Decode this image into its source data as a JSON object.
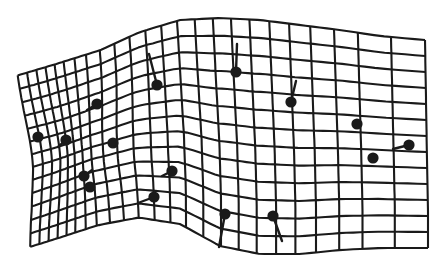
{
  "figure": {
    "type": "thin-plate-spline deformation grid",
    "width": 442,
    "height": 271,
    "background": "#ffffff",
    "ink_color": "#1a1a1a",
    "grid": {
      "columns": 24,
      "rows": 13,
      "line_width": 2.1,
      "outline": {
        "top": [
          [
            17,
            75
          ],
          [
            60,
            62
          ],
          [
            100,
            50
          ],
          [
            140,
            32
          ],
          [
            180,
            20
          ],
          [
            220,
            18
          ],
          [
            260,
            20
          ],
          [
            300,
            25
          ],
          [
            340,
            30
          ],
          [
            380,
            36
          ],
          [
            425,
            40
          ]
        ],
        "bottom": [
          [
            30,
            247
          ],
          [
            60,
            238
          ],
          [
            100,
            226
          ],
          [
            140,
            218
          ],
          [
            180,
            224
          ],
          [
            220,
            246
          ],
          [
            260,
            254
          ],
          [
            300,
            254
          ],
          [
            340,
            250
          ],
          [
            380,
            248
          ],
          [
            428,
            248
          ]
        ],
        "left": [
          [
            17,
            75
          ],
          [
            22,
            120
          ],
          [
            28,
            170
          ],
          [
            30,
            210
          ],
          [
            30,
            247
          ]
        ],
        "right": [
          [
            425,
            40
          ],
          [
            426,
            100
          ],
          [
            427,
            160
          ],
          [
            428,
            210
          ],
          [
            428,
            248
          ]
        ]
      },
      "column_bias": [
        [
          0.0,
          0.0
        ],
        [
          0.1,
          0.055
        ],
        [
          0.22,
          0.12
        ],
        [
          0.3,
          0.175
        ],
        [
          0.4,
          0.26
        ],
        [
          0.55,
          0.4
        ],
        [
          0.7,
          0.56
        ],
        [
          0.82,
          0.7
        ],
        [
          0.92,
          0.84
        ],
        [
          1.0,
          1.0
        ]
      ]
    },
    "landmarks": [
      {
        "id": 1,
        "x": 38,
        "y": 137,
        "tip_x": 38,
        "tip_y": 137
      },
      {
        "id": 2,
        "x": 66,
        "y": 140,
        "tip_x": 58,
        "tip_y": 147
      },
      {
        "id": 3,
        "x": 97,
        "y": 104,
        "tip_x": 87,
        "tip_y": 110
      },
      {
        "id": 4,
        "x": 113,
        "y": 143,
        "tip_x": 113,
        "tip_y": 143
      },
      {
        "id": 5,
        "x": 84,
        "y": 176,
        "tip_x": 92,
        "tip_y": 170
      },
      {
        "id": 6,
        "x": 90,
        "y": 187,
        "tip_x": 90,
        "tip_y": 187
      },
      {
        "id": 7,
        "x": 157,
        "y": 85,
        "tip_x": 149,
        "tip_y": 54
      },
      {
        "id": 8,
        "x": 236,
        "y": 72,
        "tip_x": 237,
        "tip_y": 44
      },
      {
        "id": 9,
        "x": 291,
        "y": 102,
        "tip_x": 296,
        "tip_y": 81
      },
      {
        "id": 10,
        "x": 357,
        "y": 124,
        "tip_x": 357,
        "tip_y": 124
      },
      {
        "id": 11,
        "x": 409,
        "y": 145,
        "tip_x": 393,
        "tip_y": 149
      },
      {
        "id": 12,
        "x": 373,
        "y": 158,
        "tip_x": 373,
        "tip_y": 158
      },
      {
        "id": 13,
        "x": 172,
        "y": 171,
        "tip_x": 162,
        "tip_y": 176
      },
      {
        "id": 14,
        "x": 154,
        "y": 197,
        "tip_x": 138,
        "tip_y": 203
      },
      {
        "id": 15,
        "x": 225,
        "y": 214,
        "tip_x": 219,
        "tip_y": 247
      },
      {
        "id": 16,
        "x": 273,
        "y": 216,
        "tip_x": 282,
        "tip_y": 241
      }
    ],
    "landmark_radius": 5.6,
    "vector_width": 2.4
  }
}
